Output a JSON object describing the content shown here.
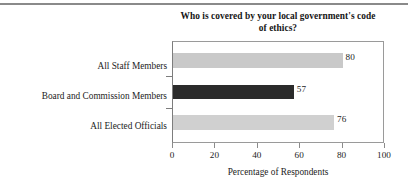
{
  "chart_data": {
    "type": "bar",
    "orientation": "horizontal",
    "title": "Who is covered by your local government's code of ethics?",
    "title_line1": "Who is covered by your local government's code",
    "title_line2": "of ethics?",
    "categories": [
      "All Staff Members",
      "Board and Commission Members",
      "All Elected Officials"
    ],
    "values": [
      80,
      57,
      76
    ],
    "value_labels": [
      "80",
      "57",
      "76"
    ],
    "bar_colors": [
      "#c9c9c9",
      "#2b2b2b",
      "#d0d0d0"
    ],
    "xlabel": "Percentage of Respondents",
    "ylabel": "",
    "xlim": [
      0,
      100
    ],
    "xticks": [
      0,
      20,
      40,
      60,
      80,
      100
    ],
    "xtick_labels": [
      "0",
      "20",
      "40",
      "60",
      "80",
      "100"
    ],
    "grid": false,
    "legend": null
  },
  "figure": {
    "rule_color": "#8a8a8a",
    "frame_color": "#9a9a9a",
    "text_color": "#1c1c1c"
  }
}
